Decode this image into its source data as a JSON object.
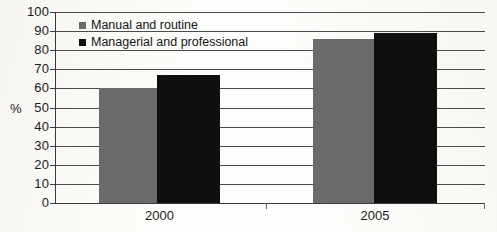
{
  "chart_data": {
    "type": "bar",
    "title": "",
    "xlabel": "",
    "ylabel": "%",
    "ylim": [
      0,
      100
    ],
    "ystep": 10,
    "grid": true,
    "legend_position": "inside-top-left",
    "categories": [
      "2000",
      "2005"
    ],
    "yticks": [
      "100",
      "90",
      "80",
      "70",
      "60",
      "50",
      "40",
      "30",
      "20",
      "10",
      "0"
    ],
    "series": [
      {
        "name": "Manual and routine",
        "color": "#6b6b6b",
        "values": [
          60,
          86
        ]
      },
      {
        "name": "Managerial and professional",
        "color": "#0f0f0f",
        "values": [
          67,
          89
        ]
      }
    ]
  },
  "colors": {
    "series_manual": "#6b6b6b",
    "series_managerial": "#0f0f0f",
    "grid": "#4a4a4a",
    "axis": "#3a3a3a",
    "text": "#1b1b1b",
    "background": "#fdfdfb"
  }
}
